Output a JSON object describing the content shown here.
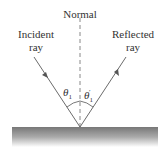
{
  "labels": {
    "normal": "Normal",
    "incident_line1": "Incident",
    "incident_line2": "ray",
    "reflected_line1": "Reflected",
    "reflected_line2": "ray",
    "theta_incident": "θ",
    "theta_incident_sub": "1",
    "theta_reflected": "θ",
    "theta_reflected_sub": "1",
    "theta_reflected_prime": "′"
  },
  "colors": {
    "ray": "#6b6b6b",
    "normal": "#888888",
    "surface_top": "#7a7a7a",
    "surface_bottom": "#ffffff"
  }
}
